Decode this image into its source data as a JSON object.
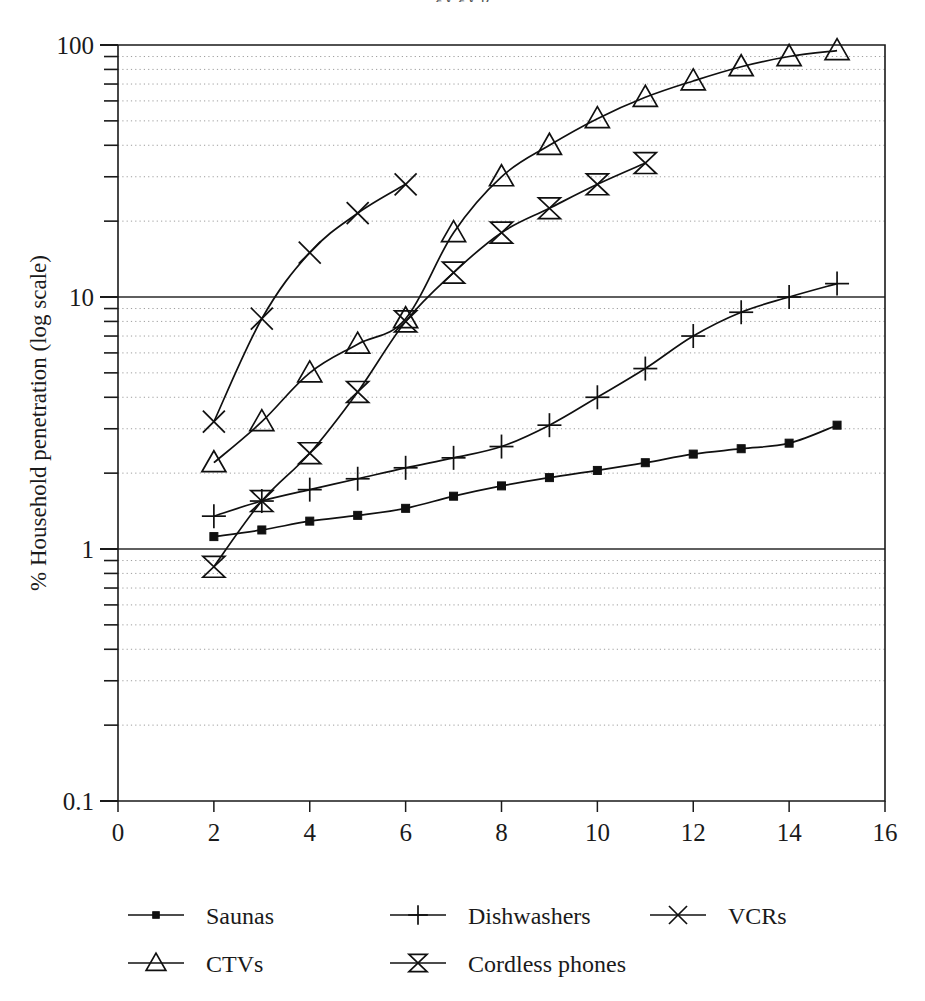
{
  "clipped_header": "gy    gy p",
  "chart_data": {
    "type": "line",
    "title": "",
    "xlabel": "",
    "ylabel": "% Household penetration (log scale)",
    "yscale": "log",
    "xlim": [
      0,
      16
    ],
    "ylim": [
      0.1,
      100
    ],
    "grid": true,
    "legend_position": "bottom",
    "x_ticks": [
      "0",
      "2",
      "4",
      "6",
      "8",
      "10",
      "12",
      "14",
      "16"
    ],
    "x_tick_values": [
      0,
      2,
      4,
      6,
      8,
      10,
      12,
      14,
      16
    ],
    "y_ticks": [
      "100",
      "10",
      "1",
      "0.1"
    ],
    "y_tick_values": [
      100,
      10,
      1,
      0.1
    ],
    "series": [
      {
        "name": "Saunas",
        "marker": "square-filled",
        "x": [
          2,
          3,
          4,
          5,
          6,
          7,
          8,
          9,
          10,
          11,
          12,
          13,
          14,
          15
        ],
        "y": [
          1.12,
          1.19,
          1.29,
          1.36,
          1.45,
          1.62,
          1.78,
          1.92,
          2.05,
          2.2,
          2.38,
          2.5,
          2.63,
          3.1
        ]
      },
      {
        "name": "Dishwashers",
        "marker": "plus",
        "x": [
          2,
          3,
          4,
          5,
          6,
          7,
          8,
          9,
          10,
          11,
          12,
          13,
          14,
          15
        ],
        "y": [
          1.35,
          1.55,
          1.72,
          1.9,
          2.1,
          2.3,
          2.55,
          3.1,
          4.0,
          5.2,
          7.0,
          8.7,
          10.0,
          11.3
        ]
      },
      {
        "name": "VCRs",
        "marker": "x",
        "x": [
          2,
          3,
          4,
          5,
          6
        ],
        "y": [
          3.2,
          8.2,
          15.0,
          21.5,
          28.0
        ]
      },
      {
        "name": "CTVs",
        "marker": "triangle-up",
        "x": [
          2,
          3,
          4,
          5,
          6,
          7,
          8,
          9,
          10,
          11,
          12,
          13,
          14,
          15
        ],
        "y": [
          2.2,
          3.2,
          5.0,
          6.5,
          8.2,
          18.0,
          30.0,
          40.0,
          51.0,
          62.0,
          72.0,
          82.0,
          90.0,
          95.0
        ]
      },
      {
        "name": "Cordless phones",
        "marker": "bowtie",
        "x": [
          2,
          3,
          4,
          5,
          6,
          7,
          8,
          9,
          10,
          11
        ],
        "y": [
          0.85,
          1.55,
          2.4,
          4.2,
          8.0,
          12.5,
          18.0,
          22.5,
          28.0,
          34.0
        ]
      }
    ],
    "legend": [
      {
        "label": "Saunas",
        "marker": "square-filled"
      },
      {
        "label": "Dishwashers",
        "marker": "plus"
      },
      {
        "label": "VCRs",
        "marker": "x"
      },
      {
        "label": "CTVs",
        "marker": "triangle-up"
      },
      {
        "label": "Cordless phones",
        "marker": "bowtie"
      }
    ]
  }
}
